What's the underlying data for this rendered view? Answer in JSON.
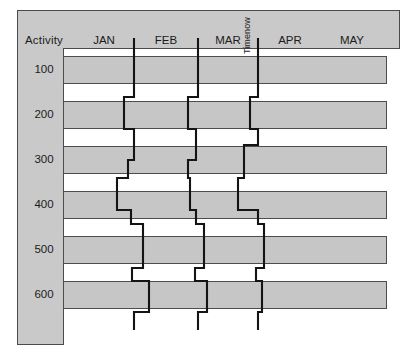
{
  "chart_data": {
    "type": "bar",
    "chart_kind": "gantt-with-status-lines",
    "title": "",
    "xlabel": "",
    "ylabel": "Activity",
    "row_header": "Activity",
    "categories": [
      "100",
      "200",
      "300",
      "400",
      "500",
      "600"
    ],
    "time_axis": {
      "tick_labels": [
        "JAN",
        "FEB",
        "MAR",
        "APR",
        "MAY"
      ],
      "tick_centers_px": [
        104,
        166,
        228,
        290,
        352
      ],
      "range_px": [
        63,
        387
      ]
    },
    "grid": false,
    "legend": null,
    "colors": {
      "panel": "#c9c9c9",
      "bar_fill": "#c6c6c6",
      "bar_border": "#4d4d4d",
      "plot_background": "#ffffff",
      "status_line": "#141414",
      "frame": "#4a4a4a",
      "text": "#1b1b1b"
    },
    "bars": [
      {
        "activity": "100",
        "start_px": 63,
        "end_px": 387,
        "top_px": 56,
        "height_px": 28
      },
      {
        "activity": "200",
        "start_px": 63,
        "end_px": 387,
        "top_px": 101,
        "height_px": 28
      },
      {
        "activity": "300",
        "start_px": 63,
        "end_px": 387,
        "top_px": 146,
        "height_px": 28
      },
      {
        "activity": "400",
        "start_px": 63,
        "end_px": 387,
        "top_px": 191,
        "height_px": 28
      },
      {
        "activity": "500",
        "start_px": 63,
        "end_px": 387,
        "top_px": 236,
        "height_px": 28
      },
      {
        "activity": "600",
        "start_px": 63,
        "end_px": 387,
        "top_px": 281,
        "height_px": 28
      }
    ],
    "row_label_tops_px": [
      63,
      108,
      153,
      198,
      243,
      288
    ],
    "status_lines": [
      {
        "name": "status-line-1",
        "baseline_px": 134,
        "label": null,
        "path": "M 134,38 L 134,97 L 124,97 L 124,129 L 134,129 L 134,160 L 128,160 L 128,178 L 117,178 L 117,210 L 131,210 L 131,224 L 143,224 L 143,268 L 132,268 L 132,281 L 149,281 L 149,312 L 134,312 L 134,330"
      },
      {
        "name": "status-line-2",
        "baseline_px": 198,
        "label": null,
        "path": "M 198,38 L 198,97 L 188,97 L 188,129 L 196,129 L 196,160 L 188,160 L 188,178 L 190,178 L 190,210 L 196,210 L 196,224 L 204,224 L 204,268 L 195,268 L 195,281 L 207,281 L 207,312 L 198,312 L 198,330"
      },
      {
        "name": "status-line-3-timenow",
        "baseline_px": 258,
        "label": "Timenow",
        "path": "M 258,38 L 258,97 L 250,97 L 250,129 L 258,129 L 258,145 L 244,145 L 244,178 L 238,178 L 238,210 L 258,210 L 258,224 L 264,224 L 264,268 L 256,268 L 256,281 L 262,281 L 262,312 L 258,312 L 258,330"
      }
    ]
  },
  "labels": {
    "row_header": "Activity",
    "months": [
      "JAN",
      "FEB",
      "MAR",
      "APR",
      "MAY"
    ],
    "activities": [
      "100",
      "200",
      "300",
      "400",
      "500",
      "600"
    ],
    "timenow": "Timenow"
  }
}
